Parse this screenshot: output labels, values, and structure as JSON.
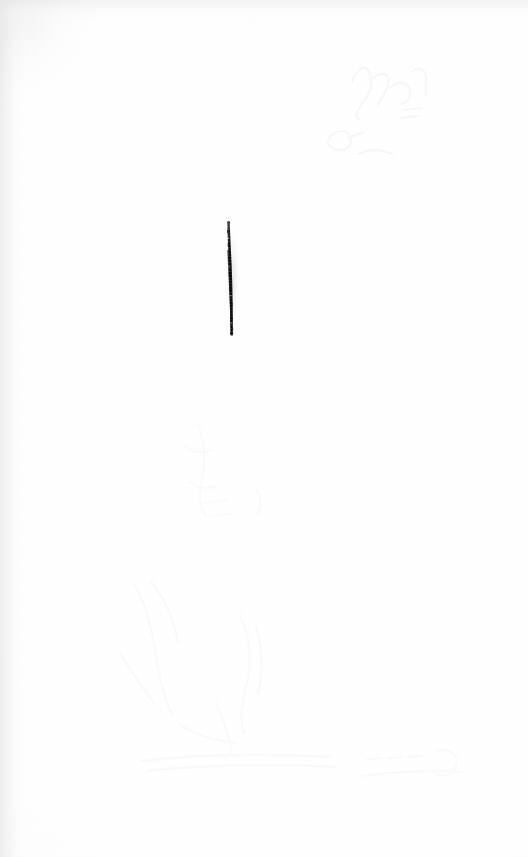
{
  "document": {
    "kind": "scanned-page",
    "surface_label": "blank paper sheet",
    "page_width": 528,
    "page_height": 857,
    "background_color": "#fefefe",
    "visible_text": ""
  },
  "marks": [
    {
      "id": "vertical-ink-stroke",
      "name": "vertical-ink-stroke",
      "description": "single dark hand-drawn vertical stroke",
      "color": "#161616",
      "x": 228,
      "y": 222,
      "width": 5,
      "height": 111
    }
  ],
  "showthrough": [
    {
      "id": "showthrough-upper-right",
      "name": "showthrough-upper-right",
      "description": "faint bleed-through of handwriting from reverse side",
      "opacity": 0.085
    },
    {
      "id": "showthrough-lower-left",
      "name": "showthrough-lower-left",
      "description": "faint bleed-through smudges from reverse side",
      "opacity": 0.055
    },
    {
      "id": "showthrough-mid-left",
      "name": "showthrough-mid-left",
      "description": "very faint bleed-through texture",
      "opacity": 0.042
    },
    {
      "id": "showthrough-bottom-right",
      "name": "showthrough-bottom-right",
      "description": "very faint bleed-through line of marks",
      "opacity": 0.05
    }
  ],
  "scan_artifacts": {
    "left_edge_shadow": true,
    "top_edge_shadow": true,
    "paper_grain": true
  }
}
